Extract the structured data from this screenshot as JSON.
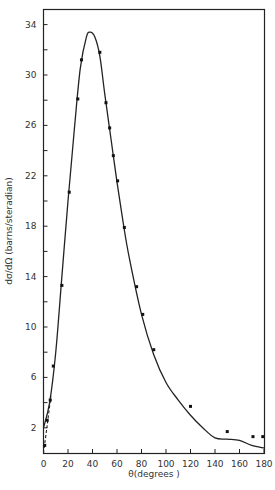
{
  "chart_data": {
    "type": "scatter",
    "title": "",
    "xlabel": "θ(degrees )",
    "ylabel": "dσ/dΩ (barns/steradian)",
    "xlim": [
      0,
      180
    ],
    "ylim": [
      0,
      35
    ],
    "x_ticks": [
      0,
      20,
      40,
      60,
      80,
      100,
      120,
      140,
      160,
      180
    ],
    "y_ticks": [
      2,
      6,
      10,
      14,
      18,
      22,
      26,
      30,
      34
    ],
    "grid": false,
    "series": [
      {
        "name": "measured",
        "style": "points",
        "x": [
          1,
          3,
          5.5,
          8,
          15,
          21,
          28,
          31,
          46,
          51,
          54,
          57,
          60.5,
          66,
          76,
          81,
          90,
          120,
          150,
          171,
          179
        ],
        "y": [
          0.6,
          2.6,
          4.2,
          6.9,
          13.3,
          20.7,
          28.1,
          31.2,
          31.8,
          27.8,
          25.8,
          23.6,
          21.6,
          17.9,
          13.2,
          11.0,
          8.2,
          3.7,
          1.7,
          1.3,
          1.3
        ]
      },
      {
        "name": "theory",
        "style": "solid-line",
        "x": [
          0,
          5,
          10,
          15,
          20,
          25,
          30,
          35,
          38,
          42,
          46,
          50,
          55,
          60,
          65,
          70,
          80,
          90,
          100,
          110,
          120,
          130,
          140,
          150,
          160,
          170,
          180
        ],
        "y": [
          2.0,
          4.0,
          8.0,
          14.0,
          20.0,
          25.5,
          30.5,
          33.0,
          33.4,
          33.0,
          31.5,
          28.5,
          25.0,
          21.5,
          18.3,
          15.5,
          11.0,
          7.8,
          5.6,
          4.2,
          3.0,
          2.0,
          1.2,
          1.1,
          1.0,
          0.6,
          0.4
        ]
      },
      {
        "name": "extrapolation",
        "style": "dashed-line",
        "x": [
          0,
          3,
          6
        ],
        "y": [
          0,
          2.2,
          4.5
        ]
      }
    ]
  }
}
